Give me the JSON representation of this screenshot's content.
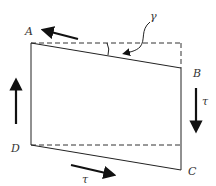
{
  "diagram": {
    "labels": {
      "A": "A",
      "B": "B",
      "C": "C",
      "D": "D",
      "gamma": "γ",
      "tau_right": "τ",
      "tau_bottom": "τ"
    },
    "colors": {
      "line": "#222222",
      "dashed": "#333333",
      "arrow": "#111111"
    }
  }
}
